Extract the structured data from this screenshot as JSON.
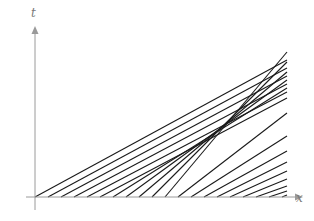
{
  "diagram": {
    "type": "characteristics",
    "axes": {
      "x_label": "x",
      "t_label": "t",
      "origin": [
        35,
        197
      ],
      "x_axis_end": [
        303,
        197
      ],
      "t_axis_end": [
        35,
        26
      ]
    },
    "colors": {
      "axis": "#9a9a9a",
      "lines": "#1a1a1a",
      "label": "#7a7a7a"
    },
    "lines": [
      {
        "x0": 35,
        "x1": 287,
        "y1": 60
      },
      {
        "x0": 48,
        "x1": 287,
        "y1": 68
      },
      {
        "x0": 61,
        "x1": 287,
        "y1": 76
      },
      {
        "x0": 74,
        "x1": 287,
        "y1": 84
      },
      {
        "x0": 87,
        "x1": 287,
        "y1": 92
      },
      {
        "x0": 100,
        "x1": 287,
        "y1": 98
      },
      {
        "x0": 113,
        "x1": 287,
        "y1": 88
      },
      {
        "x0": 126,
        "x1": 287,
        "y1": 80
      },
      {
        "x0": 139,
        "x1": 287,
        "y1": 72
      },
      {
        "x0": 152,
        "x1": 287,
        "y1": 62
      },
      {
        "x0": 165,
        "x1": 287,
        "y1": 52
      },
      {
        "x0": 178,
        "x1": 287,
        "y1": 113
      },
      {
        "x0": 191,
        "x1": 287,
        "y1": 136
      },
      {
        "x0": 204,
        "x1": 287,
        "y1": 151
      },
      {
        "x0": 217,
        "x1": 287,
        "y1": 162
      },
      {
        "x0": 230,
        "x1": 287,
        "y1": 171
      },
      {
        "x0": 243,
        "x1": 287,
        "y1": 179
      },
      {
        "x0": 256,
        "x1": 287,
        "y1": 186
      },
      {
        "x0": 269,
        "x1": 287,
        "y1": 191
      },
      {
        "x0": 282,
        "x1": 287,
        "y1": 195
      }
    ]
  }
}
